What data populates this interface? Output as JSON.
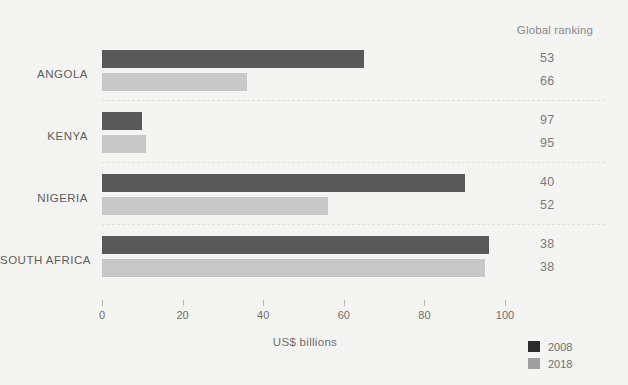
{
  "ranking_header": "Global ranking",
  "axis_title": "US$  billions",
  "colors": {
    "series_2008": "#595959",
    "series_2018": "#c8c8c8",
    "legend_2008": "#2b2b2b",
    "legend_2018": "#9f9f9f",
    "background": "#f4f4f2",
    "text": "#6e6e6e",
    "separator": "#e2e2e0"
  },
  "legend": {
    "items": [
      {
        "label": "2008",
        "key": "s2008"
      },
      {
        "label": "2018",
        "key": "s2018"
      }
    ]
  },
  "chart_data": {
    "type": "bar",
    "orientation": "horizontal",
    "title": "",
    "xlabel": "US$  billions",
    "ylabel": "",
    "xlim": [
      0,
      100
    ],
    "xticks": [
      0,
      20,
      40,
      60,
      80,
      100
    ],
    "xtick_labels": [
      "0",
      "20",
      "40",
      "60",
      "80",
      "100"
    ],
    "grid": false,
    "legend_position": "bottom-right",
    "categories": [
      "ANGOLA",
      "KENYA",
      "NIGERIA",
      "SOUTH AFRICA"
    ],
    "series": [
      {
        "name": "2008",
        "values": [
          65,
          10,
          90,
          96
        ]
      },
      {
        "name": "2018",
        "values": [
          36,
          11,
          56,
          95
        ]
      }
    ],
    "annotations": {
      "column_header": "Global ranking",
      "column_name": "Global ranking",
      "rows": [
        {
          "category": "ANGOLA",
          "rank_2008": "53",
          "rank_2018": "66"
        },
        {
          "category": "KENYA",
          "rank_2008": "97",
          "rank_2018": "95"
        },
        {
          "category": "NIGERIA",
          "rank_2008": "40",
          "rank_2018": "52"
        },
        {
          "category": "SOUTH AFRICA",
          "rank_2008": "38",
          "rank_2018": "38"
        }
      ]
    }
  }
}
